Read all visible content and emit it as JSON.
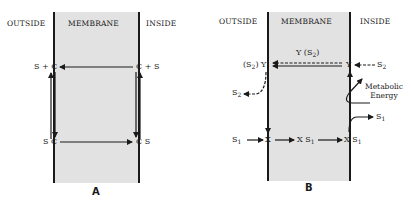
{
  "panels": {
    "a": {
      "label": "A",
      "headers": {
        "outside": "OUTSIDE",
        "membrane": "MEMBRANE",
        "inside": "INSIDE"
      },
      "species": {
        "top_left": "S + C",
        "top_right": "C + S",
        "bottom_left": "S C",
        "bottom_right": "C S"
      }
    },
    "b": {
      "label": "B",
      "headers": {
        "outside": "OUTSIDE",
        "membrane": "MEMBRANE",
        "inside": "INSIDE"
      },
      "species": {
        "carrier_complex_top": "Y (S",
        "carrier_complex_sub": "2",
        "carrier_complex_close": ")",
        "left_y_prefix": "(S",
        "left_y_sub": "2",
        "left_y_suffix": ") Y",
        "right_y": "Y",
        "s2_in": "S",
        "s2_in_sub": "2",
        "s2_out": "S",
        "s2_out_sub": "2",
        "s1_in": "S",
        "s1_in_sub": "1",
        "x_left": "X",
        "xs1_mid": "X S",
        "xs1_mid_sub": "1",
        "xs1_right": "X S",
        "xs1_right_sub": "1",
        "s1_released": "S",
        "s1_released_sub": "1",
        "energy_line1": "Metabolic",
        "energy_line2": "Energy"
      }
    }
  }
}
